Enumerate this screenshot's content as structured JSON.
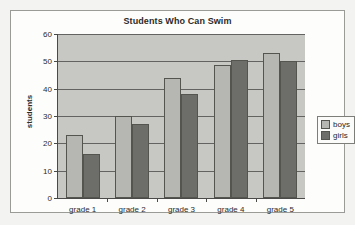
{
  "chart_data": {
    "type": "bar",
    "title": "Students Who Can Swim",
    "xlabel": "",
    "ylabel": "students",
    "categories": [
      "grade 1",
      "grade 2",
      "grade 3",
      "grade 4",
      "grade 5"
    ],
    "series": [
      {
        "name": "boys",
        "color": "#b6b6b2",
        "values": [
          23,
          30,
          44,
          48.5,
          53
        ]
      },
      {
        "name": "girls",
        "color": "#6d6d6a",
        "values": [
          16,
          27,
          38,
          50.5,
          50
        ]
      }
    ],
    "ylim": [
      0,
      60
    ],
    "yticks": [
      0,
      10,
      20,
      30,
      40,
      50,
      60
    ],
    "ytick_labels": [
      "0",
      "10",
      "20",
      "30",
      "40",
      "50",
      "60"
    ],
    "grid": true,
    "grid_axis": "y",
    "legend": [
      "boys",
      "girls"
    ],
    "legend_position": "right",
    "plot_background": "#c7c7c4",
    "frame_background": "#fdfdfc"
  }
}
